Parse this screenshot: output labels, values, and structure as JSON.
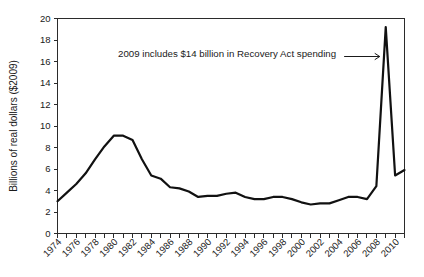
{
  "chart_data": {
    "type": "line",
    "title": "",
    "xlabel": "",
    "ylabel": "Billions of real dollars ($2009)",
    "xlim": [
      1974,
      2011
    ],
    "ylim": [
      0,
      20
    ],
    "ytick_step": 2,
    "xtick_step": 1,
    "xtick_label_step": 2,
    "grid": false,
    "legend": "none",
    "ytick_labels": [
      "0",
      "2",
      "4",
      "6",
      "8",
      "10",
      "12",
      "14",
      "16",
      "18",
      "20"
    ],
    "ytick_values": [
      0,
      2,
      4,
      6,
      8,
      10,
      12,
      14,
      16,
      18,
      20
    ],
    "xtick_labels": [
      "1974",
      "1976",
      "1978",
      "1980",
      "1982",
      "1984",
      "1986",
      "1988",
      "1990",
      "1992",
      "1994",
      "1996",
      "1998",
      "2000",
      "2002",
      "2004",
      "2006",
      "2008",
      "2010"
    ],
    "xtick_values": [
      1974,
      1976,
      1978,
      1980,
      1982,
      1984,
      1986,
      1988,
      1990,
      1992,
      1994,
      1996,
      1998,
      2000,
      2002,
      2004,
      2006,
      2008,
      2010
    ],
    "x": [
      1974,
      1975,
      1976,
      1977,
      1978,
      1979,
      1980,
      1981,
      1982,
      1983,
      1984,
      1985,
      1986,
      1987,
      1988,
      1989,
      1990,
      1991,
      1992,
      1993,
      1994,
      1995,
      1996,
      1997,
      1998,
      1999,
      2000,
      2001,
      2002,
      2003,
      2004,
      2005,
      2006,
      2007,
      2008,
      2009,
      2010,
      2011
    ],
    "values": [
      3.0,
      3.8,
      4.6,
      5.6,
      6.9,
      8.1,
      9.1,
      9.1,
      8.7,
      6.9,
      5.4,
      5.1,
      4.3,
      4.2,
      3.9,
      3.4,
      3.5,
      3.5,
      3.7,
      3.8,
      3.4,
      3.2,
      3.2,
      3.4,
      3.4,
      3.2,
      2.9,
      2.7,
      2.8,
      2.8,
      3.1,
      3.4,
      3.4,
      3.2,
      3.3,
      3.6,
      3.5,
      3.3
    ],
    "annotations": [
      {
        "text": "2009 includes $14 billion in Recovery Act spending",
        "target_x": 2009,
        "target_y": 16.6
      }
    ],
    "note_peak": {
      "year": 2009,
      "value": 19.2
    },
    "note_tail": {
      "years": [
        2010,
        2011
      ],
      "values": [
        5.4,
        5.9
      ]
    }
  },
  "series_path_values": [
    3.0,
    3.8,
    4.6,
    5.6,
    6.9,
    8.1,
    9.1,
    9.1,
    8.7,
    6.9,
    5.4,
    5.1,
    4.3,
    4.2,
    3.9,
    3.4,
    3.5,
    3.5,
    3.7,
    3.8,
    3.4,
    3.2,
    3.2,
    3.4,
    3.4,
    3.2,
    2.9,
    2.7,
    2.8,
    2.8,
    3.1,
    3.4,
    3.4,
    3.2,
    4.4,
    19.2,
    5.4,
    5.9
  ]
}
